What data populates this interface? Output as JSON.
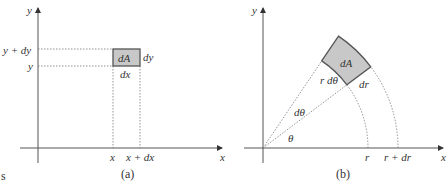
{
  "panel_a": {
    "caption": "(a)",
    "axis_x_label": "x",
    "axis_y_label": "y",
    "tick_y": "y",
    "tick_y_plus": "y + dy",
    "tick_x": "x",
    "tick_x_plus": "x + dx",
    "element_label": "dA",
    "width_label": "dx",
    "height_label": "dy",
    "element_fill": "#c8c8c8"
  },
  "panel_b": {
    "caption": "(b)",
    "axis_x_label": "x",
    "axis_y_label": "y",
    "tick_r": "r",
    "tick_r_plus": "r + dr",
    "element_label": "dA",
    "arc_label": "r dθ",
    "radial_label": "dr",
    "dtheta_label": "dθ",
    "theta_label": "θ",
    "element_fill": "#c8c8c8"
  },
  "fragment_text": "s"
}
